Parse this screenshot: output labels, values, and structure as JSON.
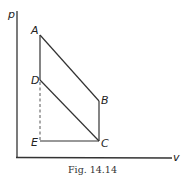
{
  "figure": {
    "caption": "Fig. 14.14",
    "axes": {
      "y_label": "p",
      "x_label": "v"
    },
    "points": {
      "A": {
        "label": "A",
        "x": 40,
        "y": 35
      },
      "B": {
        "label": "B",
        "x": 99,
        "y": 101
      },
      "C": {
        "label": "C",
        "x": 99,
        "y": 141
      },
      "D": {
        "label": "D",
        "x": 40,
        "y": 80
      },
      "E": {
        "label": "E",
        "x": 40,
        "y": 141
      }
    },
    "segments": [
      {
        "from": "A",
        "to": "B",
        "style": "solid"
      },
      {
        "from": "B",
        "to": "C",
        "style": "solid"
      },
      {
        "from": "C",
        "to": "D",
        "style": "solid"
      },
      {
        "from": "D",
        "to": "A",
        "style": "solid"
      },
      {
        "from": "E",
        "to": "C",
        "style": "solid"
      },
      {
        "from": "D",
        "to": "E",
        "style": "dashed"
      }
    ],
    "colors": {
      "line": "#333333",
      "background": "#ffffff"
    }
  }
}
